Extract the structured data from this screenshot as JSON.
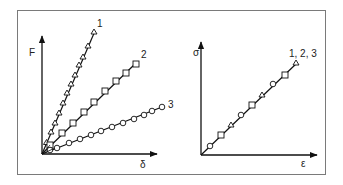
{
  "left_panel": {
    "y_axis_label": "F",
    "x_axis_label": "δ",
    "series": [
      {
        "label": "1",
        "marker": "triangle",
        "points": 12
      },
      {
        "label": "2",
        "marker": "square",
        "points": 9
      },
      {
        "label": "3",
        "marker": "circle",
        "points": 12
      }
    ]
  },
  "right_panel": {
    "y_axis_label": "σ",
    "x_axis_label": "ε",
    "series_label": "1, 2, 3",
    "markers": [
      "circle",
      "square",
      "triangle",
      "circle",
      "square",
      "triangle",
      "circle",
      "square",
      "triangle"
    ]
  }
}
